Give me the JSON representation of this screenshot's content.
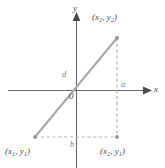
{
  "figure": {
    "type": "geometry-diagram",
    "width": 165,
    "height": 168,
    "background": "#ffffff"
  },
  "colors": {
    "axis": "#6b6b6b",
    "hypotenuse": "#a8a8a8",
    "dashed": "#b5b5b5",
    "point": "#9a9a9a",
    "text": "#4d4d4d",
    "text_light": "#7d7d7d"
  },
  "axes": {
    "x_label": "x",
    "y_label": "y",
    "origin_label": "0",
    "x_axis": {
      "x1": 8,
      "y1": 90.5,
      "x2": 148,
      "y2": 90.5,
      "arrow": "right"
    },
    "y_axis": {
      "x1": 76.5,
      "y1": 166,
      "x2": 76.5,
      "y2": 14,
      "arrow": "up"
    }
  },
  "points": [
    {
      "id": "p1",
      "label": "(x₁, y₁)",
      "label_base": "(x",
      "sub1": "1",
      "mid": ", y",
      "sub2": "1",
      "close": ")",
      "x": 35,
      "y": 137
    },
    {
      "id": "p2",
      "label": "(x₂, y₂)",
      "label_base": "(x",
      "sub1": "2",
      "mid": ", y",
      "sub2": "2",
      "close": ")",
      "x": 117,
      "y": 38
    },
    {
      "id": "p3",
      "label": "(x₂, y₁)",
      "label_base": "(x",
      "sub1": "2",
      "mid": ", y",
      "sub2": "1",
      "close": ")",
      "x": 117,
      "y": 137
    }
  ],
  "segments": {
    "hypotenuse": {
      "label": "d",
      "x1": 35,
      "y1": 137,
      "x2": 117,
      "y2": 38,
      "style": "solid"
    },
    "vertical_leg": {
      "label": "a",
      "x1": 117,
      "y1": 38,
      "x2": 117,
      "y2": 137,
      "style": "dashed"
    },
    "horizontal_leg": {
      "label": "b",
      "x1": 35,
      "y1": 137,
      "x2": 117,
      "y2": 137,
      "style": "dashed"
    }
  },
  "labels": {
    "d": "d",
    "a": "a",
    "b": "b",
    "origin": "0",
    "x": "x",
    "y": "y"
  }
}
